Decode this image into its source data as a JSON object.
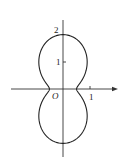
{
  "diagram": {
    "type": "polar-curve",
    "labels": {
      "origin": "O",
      "y_tick_1": "1",
      "y_tick_2": "2",
      "x_tick_1": "1"
    },
    "curve": {
      "top_y": 2,
      "bottom_y": -2,
      "x_intercepts": [
        -0.5,
        0.5
      ],
      "max_half_width": 0.85
    },
    "colors": {
      "stroke": "#222222",
      "background": "#ffffff"
    }
  }
}
